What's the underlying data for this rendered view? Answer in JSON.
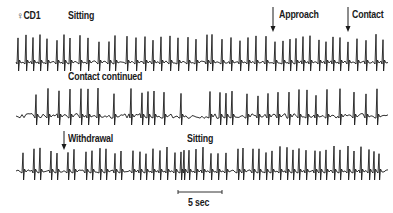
{
  "figure": {
    "subject_label": "♀CD1",
    "rows": [
      {
        "labels": [
          {
            "text": "Sitting",
            "x": 68,
            "y": 10
          },
          {
            "text": "Approach",
            "x": 279,
            "y": 9
          },
          {
            "text": "Contact",
            "x": 352,
            "y": 9
          }
        ],
        "arrows": [
          {
            "event": "Approach",
            "x": 273,
            "y1": 7,
            "y2": 32
          },
          {
            "event": "Contact",
            "x": 348,
            "y1": 7,
            "y2": 32
          }
        ],
        "baseline_y": 62,
        "spike_x": [
          18,
          26,
          33,
          40,
          47,
          57,
          64,
          70,
          80,
          88,
          99,
          109,
          115,
          127,
          136,
          145,
          153,
          161,
          170,
          178,
          188,
          196,
          207,
          212,
          222,
          231,
          240,
          248,
          256,
          266,
          275,
          283,
          290,
          296,
          303,
          310,
          319,
          326,
          333,
          340,
          348,
          357,
          366,
          376,
          383
        ],
        "spike_top": 34
      },
      {
        "labels": [
          {
            "text": "Contact continued",
            "x": 68,
            "y": 71
          }
        ],
        "baseline_y": 116,
        "spike_x": [
          36,
          48,
          59,
          70,
          81,
          88,
          98,
          114,
          131,
          142,
          148,
          154,
          164,
          181,
          210,
          220,
          226,
          232,
          247,
          258,
          268,
          278,
          289,
          299,
          307,
          316,
          327,
          340,
          354,
          366,
          377
        ],
        "spike_top": 88
      },
      {
        "labels": [
          {
            "text": "Withdrawal",
            "x": 68,
            "y": 133
          },
          {
            "text": "Sitting",
            "x": 187,
            "y": 133
          }
        ],
        "arrows": [
          {
            "event": "Withdrawal",
            "x": 64,
            "y1": 131,
            "y2": 150
          }
        ],
        "baseline_y": 171,
        "spike_x": [
          23,
          34,
          40,
          51,
          57,
          68,
          74,
          86,
          92,
          100,
          106,
          115,
          121,
          133,
          140,
          146,
          153,
          160,
          167,
          175,
          181,
          184,
          189,
          196,
          203,
          211,
          218,
          226,
          238,
          243,
          253,
          259,
          266,
          272,
          280,
          287,
          293,
          299,
          306,
          315,
          320,
          326,
          334,
          340,
          348,
          354,
          361,
          369,
          374,
          379
        ],
        "spike_top": 146
      }
    ],
    "scale_bar": {
      "label": "5 sec",
      "x1": 178,
      "x2": 222,
      "y": 192
    }
  },
  "chart_data": {
    "type": "line",
    "title": "",
    "subject": "♀CD1",
    "xlabel": "Time",
    "ylabel": "",
    "scale_bar": "5 sec",
    "traces": [
      {
        "row": 1,
        "events": [
          "Sitting",
          "Approach",
          "Contact"
        ]
      },
      {
        "row": 2,
        "events": [
          "Contact continued"
        ]
      },
      {
        "row": 3,
        "events": [
          "Withdrawal",
          "Sitting"
        ]
      }
    ],
    "grid": false
  }
}
